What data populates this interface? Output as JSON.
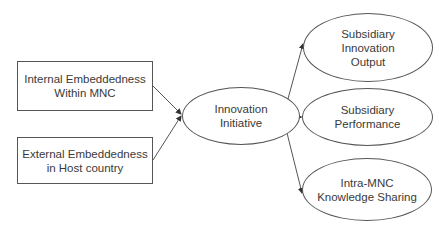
{
  "diagram": {
    "type": "flow",
    "inputs": [
      {
        "id": "internal",
        "lines": [
          "Internal Embeddedness",
          "Within MNC"
        ]
      },
      {
        "id": "external",
        "lines": [
          "External Embeddedness",
          "in Host country"
        ]
      }
    ],
    "mediator": {
      "id": "innovation",
      "lines": [
        "Innovation",
        "Initiative"
      ]
    },
    "outcomes": [
      {
        "id": "output",
        "lines": [
          "Subsidiary",
          "Innovation",
          "Output"
        ]
      },
      {
        "id": "performance",
        "lines": [
          "Subsidiary",
          "Performance"
        ]
      },
      {
        "id": "sharing",
        "lines": [
          "Intra-MNC",
          "Knowledge Sharing"
        ]
      }
    ],
    "edges": [
      {
        "from": "internal",
        "to": "innovation"
      },
      {
        "from": "external",
        "to": "innovation"
      },
      {
        "from": "innovation",
        "to": "output"
      },
      {
        "from": "innovation",
        "to": "performance"
      },
      {
        "from": "innovation",
        "to": "sharing"
      }
    ],
    "colors": {
      "stroke": "#555555",
      "text": "#3a3a3a",
      "background": "#ffffff"
    }
  }
}
